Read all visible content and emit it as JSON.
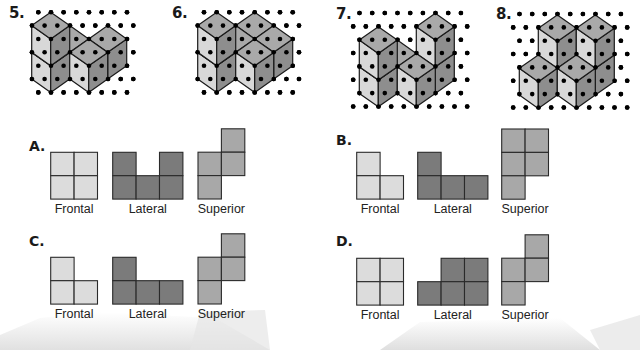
{
  "figures": [
    {
      "label": "5.",
      "x0": 50.7,
      "y0": 39,
      "cubes": [
        [
          0,
          0,
          0
        ],
        [
          0,
          0,
          1
        ],
        [
          0,
          -1,
          0
        ],
        [
          1,
          -2,
          0
        ],
        [
          1,
          -1,
          0
        ]
      ],
      "dots": {
        "x": 38.3,
        "y": 12.3,
        "cols": 8,
        "rows": 7
      },
      "label_pos": [
        9,
        4
      ]
    },
    {
      "label": "6.",
      "x0": 216.7,
      "y0": 39,
      "cubes": [
        [
          0,
          0,
          0
        ],
        [
          0,
          0,
          1
        ],
        [
          0,
          -1,
          0
        ],
        [
          0,
          -2,
          0
        ],
        [
          1,
          -2,
          0
        ],
        [
          1,
          -1,
          0
        ]
      ],
      "dots": {
        "x": 204,
        "y": 12.3,
        "cols": 8,
        "rows": 7
      },
      "label_pos": [
        172,
        4
      ]
    },
    {
      "label": "7.",
      "x0": 378.3,
      "y0": 53.4,
      "cubes": [
        [
          0,
          0,
          0
        ],
        [
          0,
          0,
          1
        ],
        [
          0,
          -1,
          0
        ],
        [
          1,
          -2,
          0
        ],
        [
          1,
          -2,
          1
        ],
        [
          1,
          -1,
          0
        ]
      ],
      "dots": {
        "x": 359.5,
        "y": 13,
        "cols": 9,
        "rows": 8
      },
      "label_pos": [
        336,
        5
      ]
    },
    {
      "label": "8.",
      "x0": 538.3,
      "y0": 55,
      "cubes": [
        [
          0,
          -1,
          0
        ],
        [
          0,
          -1,
          1
        ],
        [
          1,
          -2,
          0
        ],
        [
          1,
          -2,
          1
        ],
        [
          0,
          0,
          0
        ],
        [
          1,
          -1,
          0
        ]
      ],
      "dots": {
        "x": 519.5,
        "y": 14,
        "cols": 9,
        "rows": 8
      },
      "label_pos": [
        496,
        5
      ]
    }
  ],
  "cube_colors": {
    "top": "#a9a9a9",
    "left": "#d8d8d8",
    "right": "#8e8e8e",
    "stroke": "#1a1a1a",
    "dot": "#000000"
  },
  "options": [
    {
      "label": "A.",
      "label_pos": [
        29,
        138
      ],
      "views": [
        {
          "name": "Frontal",
          "x": 50.7,
          "y": 152.3,
          "color": "#dcdcdc",
          "cells": [
            [
              0,
              0
            ],
            [
              1,
              0
            ],
            [
              0,
              1
            ],
            [
              1,
              1
            ]
          ],
          "rows": 2
        },
        {
          "name": "Lateral",
          "x": 112.7,
          "y": 152.3,
          "color": "#7b7b7b",
          "cells": [
            [
              0,
              0
            ],
            [
              2,
              0
            ],
            [
              0,
              1
            ],
            [
              1,
              1
            ],
            [
              2,
              1
            ]
          ],
          "rows": 2
        },
        {
          "name": "Superior",
          "x": 198,
          "y": 128.8,
          "color": "#a8a8a8",
          "cells": [
            [
              1,
              0
            ],
            [
              0,
              1
            ],
            [
              1,
              1
            ],
            [
              0,
              2
            ]
          ],
          "rows": 3
        }
      ]
    },
    {
      "label": "B.",
      "label_pos": [
        336,
        132
      ],
      "views": [
        {
          "name": "Frontal",
          "x": 356.7,
          "y": 152.3,
          "color": "#dcdcdc",
          "cells": [
            [
              0,
              0
            ],
            [
              0,
              1
            ],
            [
              1,
              1
            ]
          ],
          "rows": 2
        },
        {
          "name": "Lateral",
          "x": 417.7,
          "y": 152.3,
          "color": "#7b7b7b",
          "cells": [
            [
              0,
              0
            ],
            [
              0,
              1
            ],
            [
              1,
              1
            ],
            [
              2,
              1
            ]
          ],
          "rows": 2
        },
        {
          "name": "Superior",
          "x": 501.7,
          "y": 129,
          "color": "#a8a8a8",
          "cells": [
            [
              0,
              0
            ],
            [
              1,
              0
            ],
            [
              0,
              1
            ],
            [
              1,
              1
            ],
            [
              0,
              2
            ]
          ],
          "rows": 3
        }
      ]
    },
    {
      "label": "C.",
      "label_pos": [
        29,
        233
      ],
      "views": [
        {
          "name": "Frontal",
          "x": 50.7,
          "y": 257.3,
          "color": "#dcdcdc",
          "cells": [
            [
              0,
              0
            ],
            [
              0,
              1
            ],
            [
              1,
              1
            ]
          ],
          "rows": 2
        },
        {
          "name": "Lateral",
          "x": 112.7,
          "y": 257.3,
          "color": "#7b7b7b",
          "cells": [
            [
              0,
              0
            ],
            [
              0,
              1
            ],
            [
              1,
              1
            ],
            [
              2,
              1
            ]
          ],
          "rows": 2
        },
        {
          "name": "Superior",
          "x": 198,
          "y": 233.8,
          "color": "#a8a8a8",
          "cells": [
            [
              1,
              0
            ],
            [
              0,
              1
            ],
            [
              1,
              1
            ],
            [
              0,
              2
            ]
          ],
          "rows": 3
        }
      ]
    },
    {
      "label": "D.",
      "label_pos": [
        336,
        233
      ],
      "views": [
        {
          "name": "Frontal",
          "x": 356.7,
          "y": 258.3,
          "color": "#dcdcdc",
          "cells": [
            [
              0,
              0
            ],
            [
              1,
              0
            ],
            [
              0,
              1
            ],
            [
              1,
              1
            ]
          ],
          "rows": 2
        },
        {
          "name": "Lateral",
          "x": 417.7,
          "y": 258.3,
          "color": "#7b7b7b",
          "cells": [
            [
              1,
              0
            ],
            [
              2,
              0
            ],
            [
              0,
              1
            ],
            [
              1,
              1
            ],
            [
              2,
              1
            ]
          ],
          "rows": 2
        },
        {
          "name": "Superior",
          "x": 501.7,
          "y": 234.8,
          "color": "#a8a8a8",
          "cells": [
            [
              1,
              0
            ],
            [
              0,
              1
            ],
            [
              1,
              1
            ],
            [
              0,
              2
            ]
          ],
          "rows": 3
        }
      ]
    }
  ],
  "cell_size": 23.4
}
